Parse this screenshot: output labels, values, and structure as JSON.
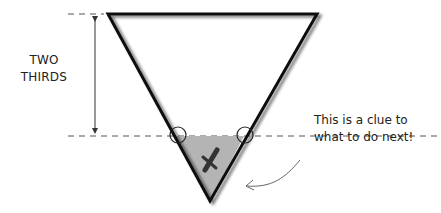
{
  "diagram": {
    "measurement_label": [
      "TWO",
      "THIRDS"
    ],
    "annotation": [
      "This is a clue to",
      "what to do next!"
    ],
    "mark_glyph": "✘",
    "colors": {
      "stroke": "#111111",
      "dash": "#555555",
      "shaded_region": "#b4b4b4",
      "mark": "#333333",
      "arrow": "#555555"
    }
  }
}
